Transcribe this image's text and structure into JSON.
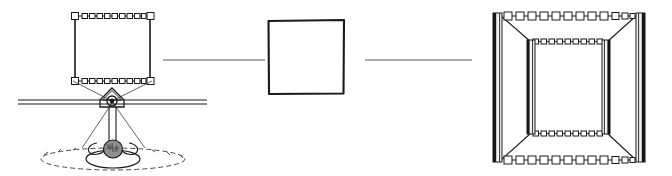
{
  "figure": {
    "title": "",
    "caption": "",
    "background_color": "#ffffff",
    "ink_color": "#1a1a1a",
    "soft_ink_color": "#5a5a5a",
    "width": 672,
    "height": 176,
    "style": "hand-drawn line diagram, no text labels"
  },
  "panels": [
    {
      "id": "panel-left",
      "name": "sensor-and-target-frame-view",
      "label": "",
      "description": "Elevation view: ground line with a small camera/sensor housing, projection rays up to a rectangular beaded frame target, and a base object on a dashed oval ground footprint.",
      "elements": [
        {
          "name": "target-frame",
          "label": "",
          "type": "rectangle-frame",
          "x": 73,
          "y": 14,
          "width": 78,
          "height": 68,
          "top_edge_style": "beaded-chain",
          "bottom_edge_style": "beaded-chain",
          "side_edge_style": "solid-line",
          "bead_count_top": 11,
          "bead_count_bottom": 12
        },
        {
          "name": "ground-line",
          "label": "",
          "type": "double-horizontal-line",
          "x1": 18,
          "x2": 207,
          "y": 101,
          "line_gap": 4
        },
        {
          "name": "sensor-housing",
          "label": "",
          "type": "triangular-housing-with-lens",
          "cx": 112,
          "cy": 99,
          "width": 24,
          "height": 18
        },
        {
          "name": "sensor-lens",
          "label": "",
          "type": "circle",
          "cx": 112,
          "cy": 101,
          "r": 4.5
        },
        {
          "name": "projection-ray-left",
          "label": "",
          "type": "line",
          "x1": 112,
          "y1": 101,
          "x2": 73,
          "y2": 82
        },
        {
          "name": "projection-ray-right",
          "label": "",
          "type": "line",
          "x1": 112,
          "y1": 101,
          "x2": 151,
          "y2": 82
        },
        {
          "name": "mount-post",
          "label": "",
          "type": "vertical-double-line",
          "x": 112,
          "y1": 106,
          "y2": 148
        },
        {
          "name": "base-object",
          "label": "",
          "type": "shaded-blob",
          "cx": 113,
          "cy": 150,
          "rx": 9,
          "ry": 8
        },
        {
          "name": "base-platform",
          "label": "",
          "type": "oval",
          "cx": 113,
          "cy": 160,
          "rx": 27,
          "ry": 9
        },
        {
          "name": "ground-footprint-dashed",
          "label": "",
          "type": "dashed-oval",
          "cx": 113,
          "cy": 160,
          "rx": 72,
          "ry": 11
        }
      ]
    },
    {
      "id": "panel-middle",
      "name": "abstract-square-view",
      "label": "",
      "description": "Plain hand-drawn square outline representing the frame seen head-on.",
      "elements": [
        {
          "name": "abstract-square",
          "label": "",
          "type": "square-outline",
          "x": 268,
          "y": 20,
          "width": 76,
          "height": 74,
          "stroke_width": 2
        }
      ]
    },
    {
      "id": "panel-right",
      "name": "perspective-frame-view",
      "label": "",
      "description": "Three-dimensional perspective of the same frame: a large near rectangle and a smaller far rectangle joined by corner lines, with shaded vertical posts at all four corners and beaded horizontal rails.",
      "elements": [
        {
          "name": "near-frame",
          "label": "",
          "type": "rectangle-frame",
          "x": 492,
          "y": 14,
          "width": 152,
          "height": 148,
          "top_edge_style": "beaded-chain",
          "bottom_edge_style": "beaded-chain",
          "bead_count_top": 16,
          "bead_count_bottom": 16
        },
        {
          "name": "far-frame",
          "label": "",
          "type": "rectangle-frame",
          "x": 526,
          "y": 40,
          "width": 84,
          "height": 94,
          "top_edge_style": "beaded-chain",
          "bottom_edge_style": "beaded-chain",
          "bead_count_top": 13,
          "bead_count_bottom": 12
        },
        {
          "name": "post-near-left",
          "label": "",
          "type": "shaded-vertical-post",
          "x": 492,
          "y": 14,
          "width": 9,
          "height": 148
        },
        {
          "name": "post-near-right",
          "label": "",
          "type": "shaded-vertical-post",
          "x": 635,
          "y": 14,
          "width": 9,
          "height": 148
        },
        {
          "name": "post-far-left",
          "label": "",
          "type": "shaded-vertical-post",
          "x": 526,
          "y": 40,
          "width": 8,
          "height": 94
        },
        {
          "name": "post-far-right",
          "label": "",
          "type": "shaded-vertical-post",
          "x": 602,
          "y": 40,
          "width": 8,
          "height": 94
        },
        {
          "name": "depth-edge-top-left",
          "label": "",
          "type": "line",
          "x1": 500,
          "y1": 16,
          "x2": 530,
          "y2": 42
        },
        {
          "name": "depth-edge-top-right",
          "label": "",
          "type": "line",
          "x1": 636,
          "y1": 16,
          "x2": 608,
          "y2": 42
        },
        {
          "name": "depth-edge-bottom-left",
          "label": "",
          "type": "line",
          "x1": 500,
          "y1": 160,
          "x2": 530,
          "y2": 133
        },
        {
          "name": "depth-edge-bottom-right",
          "label": "",
          "type": "line",
          "x1": 636,
          "y1": 160,
          "x2": 608,
          "y2": 133
        }
      ]
    }
  ],
  "connectors": [
    {
      "name": "connector-left-to-middle",
      "label": "",
      "type": "horizontal-line",
      "x1": 163,
      "x2": 265,
      "y": 60
    },
    {
      "name": "connector-middle-to-right",
      "label": "",
      "type": "horizontal-line",
      "x1": 365,
      "x2": 472,
      "y": 60
    }
  ],
  "colors": {
    "ink": "#1a1a1a",
    "soft_ink": "#5a5a5a",
    "post_face": "#f2f2f2",
    "post_shadow": "#151515",
    "background": "#ffffff"
  }
}
